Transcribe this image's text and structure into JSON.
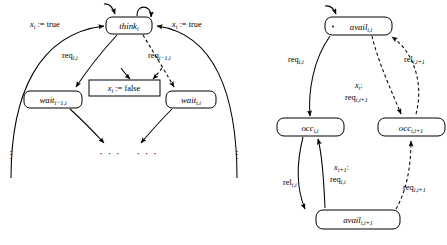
{
  "figure": {
    "type": "two-automata-diagram"
  },
  "left_automaton": {
    "name": "philosopher-automaton",
    "nodes": [
      {
        "id": "think",
        "base": "think",
        "sub": "i",
        "shape": "rounded",
        "initial": true
      },
      {
        "id": "waitL",
        "base": "wait",
        "sub": "i−1,i",
        "shape": "rounded",
        "initial": false
      },
      {
        "id": "waitR",
        "base": "wait",
        "sub": "i,i",
        "shape": "rounded",
        "initial": false
      },
      {
        "id": "assign",
        "base": "x",
        "sub": "i",
        "suffix": " := false",
        "shape": "rect",
        "initial": false
      }
    ],
    "edges": [
      {
        "id": "think-self",
        "label_base": "",
        "style": "solid",
        "kind": "self-loop"
      },
      {
        "id": "think-waitL",
        "label_base": "req",
        "label_sub": "i,i",
        "style": "solid",
        "kind": "down-left"
      },
      {
        "id": "think-waitR",
        "label_base": "req",
        "label_sub": "i−1,i",
        "style": "dashed",
        "kind": "down-right"
      },
      {
        "id": "think-assign-left",
        "style": "solid",
        "kind": "to-assign-box"
      },
      {
        "id": "think-assign-right",
        "style": "dashed",
        "kind": "to-assign-box"
      },
      {
        "id": "outerL-think",
        "label_base": "x",
        "label_sub": "i",
        "label_suffix": " := true",
        "style": "solid",
        "kind": "big-arc-left"
      },
      {
        "id": "outerR-think",
        "label_base": "x",
        "label_sub": "i",
        "label_suffix": " := true",
        "style": "solid",
        "kind": "big-arc-right"
      },
      {
        "id": "waitL-dots",
        "style": "solid",
        "kind": "down-to-dots"
      },
      {
        "id": "waitR-dots",
        "style": "solid",
        "kind": "down-to-dots"
      }
    ],
    "ellipses": [
      {
        "id": "dots-far-left",
        "glyph": "⋮"
      },
      {
        "id": "dots-mid-left",
        "glyph": "· · ·"
      },
      {
        "id": "dots-mid-right",
        "glyph": "· · ·"
      },
      {
        "id": "dots-far-right",
        "glyph": "⋮"
      }
    ]
  },
  "right_automaton": {
    "name": "fork-automaton",
    "nodes": [
      {
        "id": "availTop",
        "base": "avail",
        "sub": "i,i",
        "shape": "rounded",
        "initial": true
      },
      {
        "id": "occL",
        "base": "occ",
        "sub": "i,i",
        "shape": "rounded",
        "initial": false
      },
      {
        "id": "occR",
        "base": "occ",
        "sub": "i,i+1",
        "shape": "rounded",
        "initial": false
      },
      {
        "id": "availBot",
        "base": "avail",
        "sub": "i,i+1",
        "shape": "rounded",
        "initial": false
      }
    ],
    "edges": [
      {
        "id": "availTop-occL",
        "label_base": "req",
        "label_sub": "i,i",
        "style": "solid",
        "kind": "curve-down-left"
      },
      {
        "id": "availTop-occR",
        "label_base": "req",
        "label_sub": "i,i+1",
        "label_prefix_base": "x",
        "label_prefix_sub": "i",
        "label_prefix_suffix": ":",
        "style": "dashed",
        "kind": "curve-down-right"
      },
      {
        "id": "occR-availTop",
        "label_base": "rel",
        "label_sub": "i,i+1",
        "style": "dashed",
        "kind": "curve-up-right"
      },
      {
        "id": "occL-availBot",
        "label_base": "rel",
        "label_sub": "i,i",
        "style": "solid",
        "kind": "curve-down"
      },
      {
        "id": "availBot-occL",
        "label_base": "req",
        "label_sub": "i,i",
        "label_prefix_base": "x",
        "label_prefix_sub": "i+1",
        "label_prefix_suffix": ":",
        "style": "solid",
        "kind": "curve-up"
      },
      {
        "id": "availBot-occR",
        "label_base": "req",
        "label_sub": "i,i+1",
        "style": "dashed",
        "kind": "curve-up-right2"
      }
    ]
  },
  "labels": {
    "x_true_left": {
      "base": "x",
      "sub": "i",
      "suffix": " := true"
    },
    "x_true_right": {
      "base": "x",
      "sub": "i",
      "suffix": " := true"
    },
    "x_false": {
      "base": "x",
      "sub": "i",
      "suffix": " := false"
    },
    "req_i_i": {
      "base": "req",
      "sub": "i,i"
    },
    "req_im1_i": {
      "base": "req",
      "sub": "i−1,i"
    },
    "req_i_ip1": {
      "base": "req",
      "sub": "i,i+1"
    },
    "rel_i_i": {
      "base": "rel",
      "sub": "i,i"
    },
    "rel_i_ip1": {
      "base": "rel",
      "sub": "i,i+1"
    },
    "x_i_colon": {
      "base": "x",
      "sub": "i",
      "suffix": ":"
    },
    "x_ip1_colon": {
      "base": "x",
      "sub": "i+1",
      "suffix": ":"
    },
    "think_i": {
      "base": "think",
      "sub": "i"
    },
    "wait_im1_i": {
      "base": "wait",
      "sub": "i−1,i"
    },
    "wait_i_i": {
      "base": "wait",
      "sub": "i,i"
    },
    "avail_i_i": {
      "base": "avail",
      "sub": "i,i"
    },
    "avail_i_ip1": {
      "base": "avail",
      "sub": "i,i+1"
    },
    "occ_i_i": {
      "base": "occ",
      "sub": "i,i"
    },
    "occ_i_ip1": {
      "base": "occ",
      "sub": "i,i+1"
    },
    "vdots": {
      "glyph": "⋮"
    },
    "hdots": {
      "glyph": "· · ·"
    }
  },
  "colors": {
    "stroke": "#000000",
    "fill": "#ffffff",
    "background": "#ffffff"
  }
}
